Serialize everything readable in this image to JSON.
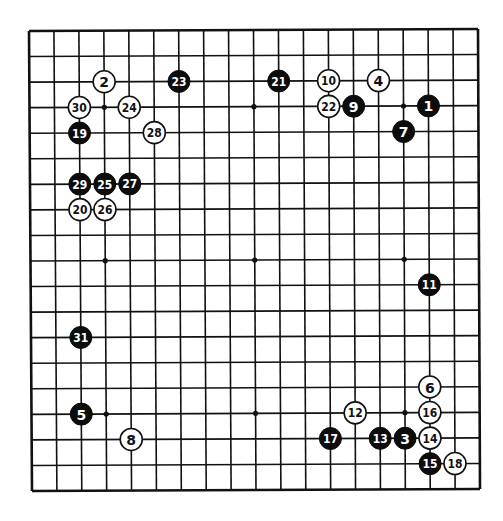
{
  "diagram": {
    "type": "go-board-kifu",
    "board_size": 19,
    "colors": {
      "black": "#0c0c0c",
      "white": "#ffffff",
      "line": "#111111",
      "background": "#ffffff"
    },
    "star_points": [
      [
        3,
        3
      ],
      [
        9,
        3
      ],
      [
        15,
        3
      ],
      [
        3,
        9
      ],
      [
        9,
        9
      ],
      [
        15,
        9
      ],
      [
        3,
        15
      ],
      [
        9,
        15
      ],
      [
        15,
        15
      ]
    ],
    "moves": [
      {
        "n": "1",
        "color": "black",
        "col": 16,
        "row": 3
      },
      {
        "n": "2",
        "color": "white",
        "col": 3,
        "row": 2
      },
      {
        "n": "3",
        "color": "black",
        "col": 15,
        "row": 16
      },
      {
        "n": "4",
        "color": "white",
        "col": 14,
        "row": 2
      },
      {
        "n": "5",
        "color": "black",
        "col": 2,
        "row": 15
      },
      {
        "n": "6",
        "color": "white",
        "col": 16,
        "row": 14
      },
      {
        "n": "7",
        "color": "black",
        "col": 15,
        "row": 4
      },
      {
        "n": "8",
        "color": "white",
        "col": 4,
        "row": 16
      },
      {
        "n": "9",
        "color": "black",
        "col": 13,
        "row": 3
      },
      {
        "n": "10",
        "color": "white",
        "col": 12,
        "row": 2
      },
      {
        "n": "11",
        "color": "black",
        "col": 16,
        "row": 10
      },
      {
        "n": "12",
        "color": "white",
        "col": 13,
        "row": 15
      },
      {
        "n": "13",
        "color": "black",
        "col": 14,
        "row": 16
      },
      {
        "n": "14",
        "color": "white",
        "col": 16,
        "row": 16
      },
      {
        "n": "15",
        "color": "black",
        "col": 16,
        "row": 17
      },
      {
        "n": "16",
        "color": "white",
        "col": 16,
        "row": 15
      },
      {
        "n": "17",
        "color": "black",
        "col": 12,
        "row": 16
      },
      {
        "n": "18",
        "color": "white",
        "col": 17,
        "row": 17
      },
      {
        "n": "19",
        "color": "black",
        "col": 2,
        "row": 4
      },
      {
        "n": "20",
        "color": "white",
        "col": 2,
        "row": 7
      },
      {
        "n": "21",
        "color": "black",
        "col": 10,
        "row": 2
      },
      {
        "n": "22",
        "color": "white",
        "col": 12,
        "row": 3
      },
      {
        "n": "23",
        "color": "black",
        "col": 6,
        "row": 2
      },
      {
        "n": "24",
        "color": "white",
        "col": 4,
        "row": 3
      },
      {
        "n": "25",
        "color": "black",
        "col": 3,
        "row": 6
      },
      {
        "n": "26",
        "color": "white",
        "col": 3,
        "row": 7
      },
      {
        "n": "27",
        "color": "black",
        "col": 4,
        "row": 6
      },
      {
        "n": "28",
        "color": "white",
        "col": 5,
        "row": 4
      },
      {
        "n": "29",
        "color": "black",
        "col": 2,
        "row": 6
      },
      {
        "n": "30",
        "color": "white",
        "col": 2,
        "row": 3
      },
      {
        "n": "31",
        "color": "black",
        "col": 2,
        "row": 12
      }
    ]
  }
}
